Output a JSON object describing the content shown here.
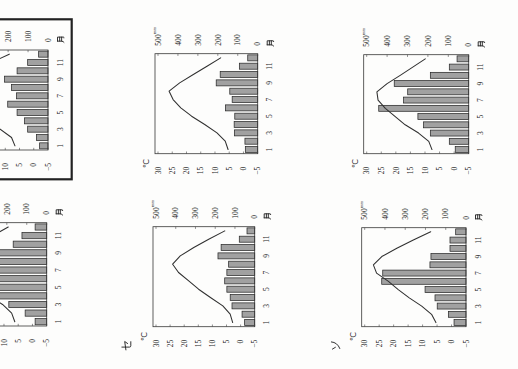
{
  "page": {
    "orientation": "page scanned rotated 90 degrees counter-clockwise",
    "highlighted_chart_index": 1
  },
  "axes": {
    "temp_unit": "℃",
    "precip_unit": "mm",
    "month_unit": "月",
    "temp_ticks": [
      "30",
      "25",
      "20",
      "15",
      "10",
      "5",
      "0",
      "−5"
    ],
    "precip_ticks": [
      "500",
      "400",
      "300",
      "200",
      "100",
      "0"
    ],
    "month_ticks": [
      "1",
      "3",
      "5",
      "7",
      "9",
      "11"
    ]
  },
  "colors": {
    "paper": "#fdfdfc",
    "ink": "#272727",
    "plot_frame": "#383838",
    "bar_fill": "#a1a1a1",
    "bar_outline": "#2b2b2b",
    "temperature_line": "#303030",
    "tick": "#444444",
    "highlight_frame": "#222222"
  },
  "chart_data": [
    {
      "type": "bar+line",
      "label": "",
      "framed": false,
      "cropped": true,
      "title": "",
      "x": [
        1,
        2,
        3,
        4,
        5,
        6,
        7,
        8,
        9,
        10,
        11,
        12
      ],
      "xlabel": "月",
      "ylabel_left": "℃",
      "ylabel_right": "mm",
      "ylim_left": [
        -5,
        30
      ],
      "ylim_right": [
        0,
        500
      ],
      "grid": false,
      "legend": null,
      "series": [
        {
          "name": "precipitation",
          "type": "bar",
          "axis": "right",
          "unit": "mm",
          "values": [
            58,
            108,
            190,
            240,
            282,
            358,
            330,
            285,
            360,
            168,
            124,
            58
          ]
        },
        {
          "name": "temperature",
          "type": "line",
          "axis": "left",
          "unit": "℃",
          "values": [
            6.2,
            7.3,
            10.5,
            15.6,
            19.7,
            22.9,
            26.7,
            27.5,
            24.7,
            19.3,
            13.8,
            8.5
          ]
        }
      ]
    },
    {
      "type": "bar+line",
      "label": "",
      "framed": true,
      "cropped": true,
      "title": "",
      "x": [
        1,
        2,
        3,
        4,
        5,
        6,
        7,
        8,
        9,
        10,
        11,
        12
      ],
      "xlabel": "月",
      "ylabel_left": "℃",
      "ylabel_right": "mm",
      "ylim_left": [
        -5,
        30
      ],
      "ylim_right": [
        0,
        500
      ],
      "grid": false,
      "legend": null,
      "series": [
        {
          "name": "precipitation",
          "type": "bar",
          "axis": "right",
          "unit": "mm",
          "values": [
            42,
            58,
            102,
            118,
            155,
            202,
            158,
            183,
            218,
            155,
            102,
            47
          ]
        },
        {
          "name": "temperature",
          "type": "line",
          "axis": "left",
          "unit": "℃",
          "values": [
            6.6,
            7.8,
            11.8,
            16.0,
            20.0,
            23.3,
            27.0,
            28.2,
            24.8,
            19.3,
            14.8,
            8.6
          ]
        }
      ]
    },
    {
      "type": "bar+line",
      "label": "セ",
      "framed": false,
      "cropped": false,
      "title": "",
      "x": [
        1,
        2,
        3,
        4,
        5,
        6,
        7,
        8,
        9,
        10,
        11,
        12
      ],
      "xlabel": "月",
      "ylabel_left": "℃",
      "ylabel_right": "mm",
      "ylim_left": [
        -5,
        30
      ],
      "ylim_right": [
        0,
        500
      ],
      "grid": false,
      "legend": null,
      "series": [
        {
          "name": "precipitation",
          "type": "bar",
          "axis": "right",
          "unit": "mm",
          "values": [
            51,
            64,
            115,
            124,
            141,
            152,
            141,
            132,
            186,
            170,
            78,
            39
          ]
        },
        {
          "name": "temperature",
          "type": "line",
          "axis": "left",
          "unit": "℃",
          "values": [
            2.8,
            3.7,
            6.3,
            10.7,
            14.9,
            18.4,
            22.0,
            24.1,
            21.4,
            16.6,
            11.3,
            5.6
          ]
        }
      ]
    },
    {
      "type": "bar+line",
      "label": "",
      "framed": false,
      "cropped": false,
      "title": "",
      "x": [
        1,
        2,
        3,
        4,
        5,
        6,
        7,
        8,
        9,
        10,
        11,
        12
      ],
      "xlabel": "月",
      "ylabel_left": "℃",
      "ylabel_right": "mm",
      "ylim_left": [
        -5,
        30
      ],
      "ylim_right": [
        0,
        500
      ],
      "grid": false,
      "legend": null,
      "series": [
        {
          "name": "precipitation",
          "type": "bar",
          "axis": "right",
          "unit": "mm",
          "values": [
            62,
            64,
            117,
            118,
            115,
            162,
            128,
            140,
            208,
            188,
            92,
            50
          ]
        },
        {
          "name": "temperature",
          "type": "line",
          "axis": "left",
          "unit": "℃",
          "values": [
            5.4,
            6.4,
            9.3,
            13.6,
            18.2,
            22.0,
            24.7,
            26.1,
            22.4,
            17.6,
            12.8,
            8.0
          ]
        }
      ]
    },
    {
      "type": "bar+line",
      "label": "ソ",
      "framed": false,
      "cropped": false,
      "title": "",
      "x": [
        1,
        2,
        3,
        4,
        5,
        6,
        7,
        8,
        9,
        10,
        11,
        12
      ],
      "xlabel": "月",
      "ylabel_left": "℃",
      "ylabel_right": "mm",
      "ylim_left": [
        -5,
        30
      ],
      "ylim_right": [
        0,
        500
      ],
      "grid": false,
      "legend": null,
      "series": [
        {
          "name": "precipitation",
          "type": "bar",
          "axis": "right",
          "unit": "mm",
          "values": [
            59,
            87,
            142,
            153,
            202,
            416,
            411,
            178,
            173,
            79,
            79,
            51
          ]
        },
        {
          "name": "temperature",
          "type": "line",
          "axis": "left",
          "unit": "℃",
          "values": [
            5.4,
            6.9,
            10.3,
            14.6,
            18.4,
            21.8,
            25.9,
            27.0,
            24.1,
            18.9,
            13.2,
            7.2
          ]
        }
      ]
    },
    {
      "type": "bar+line",
      "label": "",
      "framed": false,
      "cropped": false,
      "title": "",
      "x": [
        1,
        2,
        3,
        4,
        5,
        6,
        7,
        8,
        9,
        10,
        11,
        12
      ],
      "xlabel": "月",
      "ylabel_left": "℃",
      "ylabel_right": "mm",
      "ylim_left": [
        -5,
        30
      ],
      "ylim_right": [
        0,
        500
      ],
      "grid": false,
      "legend": null,
      "series": [
        {
          "name": "precipitation",
          "type": "bar",
          "axis": "right",
          "unit": "mm",
          "values": [
            66,
            95,
            188,
            221,
            249,
            441,
            319,
            299,
            365,
            188,
            95,
            57
          ]
        },
        {
          "name": "temperature",
          "type": "line",
          "axis": "left",
          "unit": "℃",
          "values": [
            7.6,
            8.7,
            12.2,
            16.8,
            20.2,
            23.6,
            26.1,
            26.5,
            23.0,
            18.5,
            14.2,
            9.9
          ]
        }
      ]
    }
  ]
}
